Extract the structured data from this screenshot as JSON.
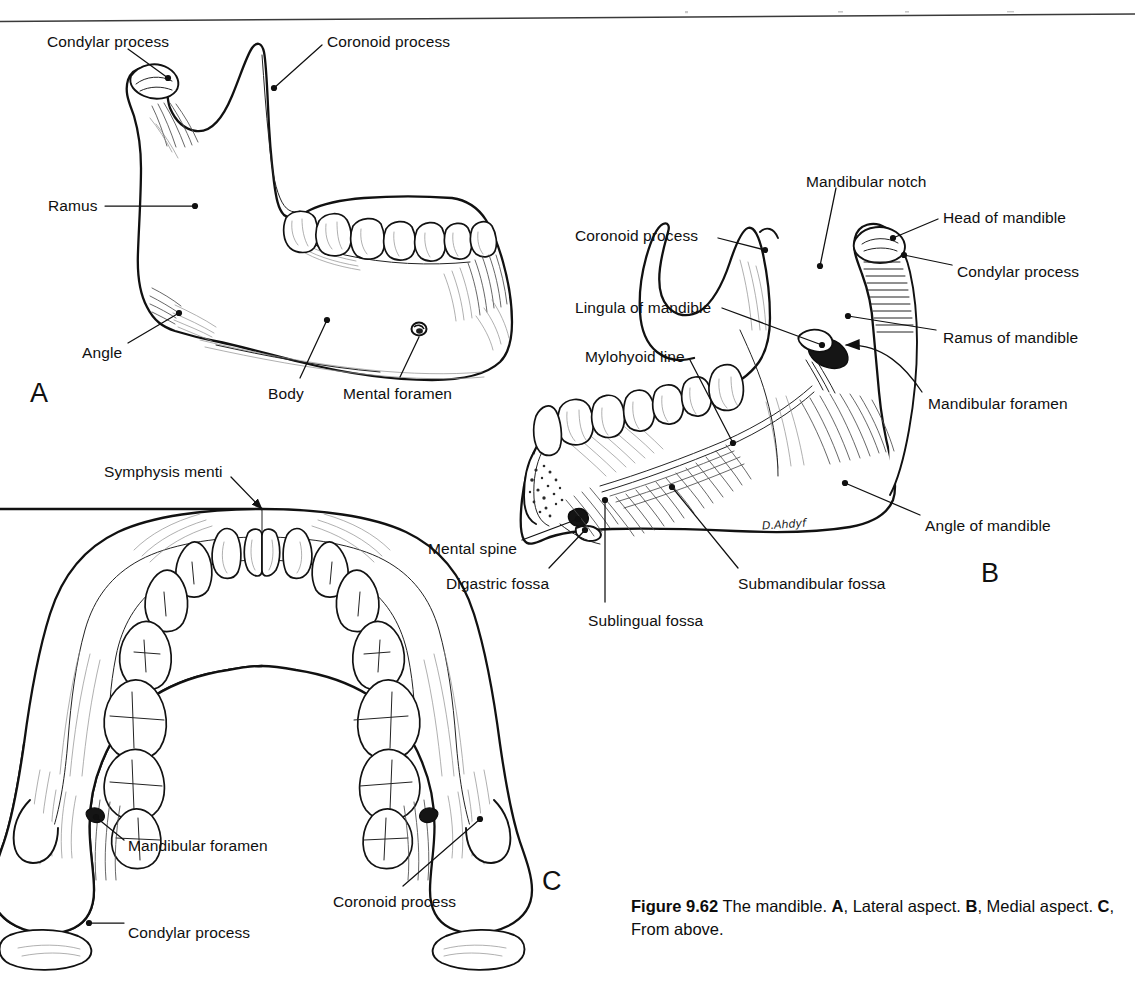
{
  "figure": {
    "number": "Figure 9.62",
    "title_text": " The mandible. ",
    "caption_parts": [
      {
        "text": "Figure 9.62",
        "bold": true
      },
      {
        "text": " The mandible. ",
        "bold": false
      },
      {
        "text": "A",
        "bold": true
      },
      {
        "text": ", Lateral aspect. ",
        "bold": false
      },
      {
        "text": "B",
        "bold": true
      },
      {
        "text": ", Medial aspect. ",
        "bold": false
      },
      {
        "text": "C",
        "bold": true
      },
      {
        "text": ", From above.",
        "bold": false
      }
    ],
    "caption_plain": "Figure 9.62 The mandible. A, Lateral aspect. B, Medial aspect. C, From above.",
    "artist_signature": "D.Ahdyf"
  },
  "panels": [
    {
      "letter": "A",
      "name": "lateral-aspect",
      "description": "Lateral aspect",
      "labels": [
        {
          "id": "a-condylar-process",
          "text": "Condylar process",
          "x": 47,
          "y": 34,
          "align": "left",
          "leader": {
            "type": "line",
            "points": [
              [
                128,
                49
              ],
              [
                168,
                78
              ]
            ]
          },
          "dot": [
            168,
            78
          ]
        },
        {
          "id": "a-coronoid-process",
          "text": "Coronoid process",
          "x": 327,
          "y": 34,
          "align": "left",
          "leader": {
            "type": "line",
            "points": [
              [
                322,
                45
              ],
              [
                274,
                88
              ]
            ]
          },
          "dot": [
            274,
            88
          ]
        },
        {
          "id": "a-ramus",
          "text": "Ramus",
          "x": 48,
          "y": 198,
          "align": "left",
          "leader": {
            "type": "line",
            "points": [
              [
                105,
                206
              ],
              [
                195,
                206
              ]
            ]
          },
          "dot": [
            195,
            206
          ]
        },
        {
          "id": "a-angle",
          "text": "Angle",
          "x": 82,
          "y": 345,
          "align": "left",
          "leader": {
            "type": "line",
            "points": [
              [
                128,
                343
              ],
              [
                179,
                313
              ]
            ]
          },
          "dot": [
            179,
            313
          ]
        },
        {
          "id": "a-body",
          "text": "Body",
          "x": 268,
          "y": 386,
          "align": "left",
          "leader": {
            "type": "line",
            "points": [
              [
                300,
                378
              ],
              [
                327,
                320
              ]
            ]
          },
          "dot": [
            327,
            320
          ]
        },
        {
          "id": "a-mental-foramen",
          "text": "Mental foramen",
          "x": 343,
          "y": 386,
          "align": "left",
          "leader": {
            "type": "line",
            "points": [
              [
                400,
                377
              ],
              [
                419,
                329
              ]
            ]
          },
          "dot": [
            419,
            329
          ]
        }
      ]
    },
    {
      "letter": "B",
      "name": "medial-aspect",
      "description": "Medial aspect",
      "labels": [
        {
          "id": "b-mandibular-notch",
          "text": "Mandibular notch",
          "x": 806,
          "y": 174,
          "align": "left",
          "leader": {
            "type": "line",
            "points": [
              [
                836,
                188
              ],
              [
                820,
                266
              ]
            ]
          },
          "dot": [
            820,
            266
          ]
        },
        {
          "id": "b-head-of-mandible",
          "text": "Head of mandible",
          "x": 943,
          "y": 210,
          "align": "left",
          "leader": {
            "type": "line",
            "points": [
              [
                938,
                219
              ],
              [
                893,
                238
              ]
            ]
          },
          "dot": [
            893,
            238
          ]
        },
        {
          "id": "b-condylar-process",
          "text": "Condylar process",
          "x": 957,
          "y": 264,
          "align": "left",
          "leader": {
            "type": "line",
            "points": [
              [
                952,
                265
              ],
              [
                904,
                255
              ]
            ]
          },
          "dot": [
            904,
            255
          ]
        },
        {
          "id": "b-coronoid-process",
          "text": "Coronoid process",
          "x": 575,
          "y": 228,
          "align": "left",
          "leader": {
            "type": "line",
            "points": [
              [
                718,
                238
              ],
              [
                765,
                250
              ]
            ]
          },
          "dot": [
            765,
            250
          ]
        },
        {
          "id": "b-lingula",
          "text": "Lingula of mandible",
          "x": 575,
          "y": 300,
          "align": "left",
          "leader": {
            "type": "line",
            "points": [
              [
                722,
                308
              ],
              [
                822,
                345
              ]
            ]
          },
          "dot": [
            822,
            345
          ]
        },
        {
          "id": "b-ramus-of-mandible",
          "text": "Ramus of mandible",
          "x": 943,
          "y": 330,
          "align": "left",
          "leader": {
            "type": "line",
            "points": [
              [
                936,
                330
              ],
              [
                848,
                316
              ]
            ]
          },
          "dot": [
            848,
            316
          ]
        },
        {
          "id": "b-mylohyoid-line",
          "text": "Mylohyoid line",
          "x": 585,
          "y": 349,
          "align": "left",
          "leader": {
            "type": "line",
            "points": [
              [
                690,
                360
              ],
              [
                733,
                443
              ]
            ]
          },
          "dot": [
            733,
            443
          ]
        },
        {
          "id": "b-mandibular-foramen",
          "text": "Mandibular foramen",
          "x": 928,
          "y": 396,
          "align": "left",
          "leader": {
            "type": "arc",
            "points": [
              [
                922,
                392
              ],
              [
                905,
                330
              ],
              [
                840,
                348
              ]
            ]
          },
          "arrow": true
        },
        {
          "id": "b-angle-of-mandible",
          "text": "Angle of mandible",
          "x": 925,
          "y": 518,
          "align": "left",
          "leader": {
            "type": "line",
            "points": [
              [
                920,
                515
              ],
              [
                845,
                483
              ]
            ]
          },
          "dot": [
            845,
            483
          ]
        },
        {
          "id": "b-mental-spine",
          "text": "Mental spine",
          "x": 428,
          "y": 541,
          "align": "left",
          "leader": {
            "type": "line",
            "points": [
              [
                522,
                540
              ],
              [
                578,
                519
              ]
            ]
          },
          "dot": [
            578,
            519
          ]
        },
        {
          "id": "b-digastric-fossa",
          "text": "Digastric fossa",
          "x": 446,
          "y": 576,
          "align": "left",
          "leader": {
            "type": "line",
            "points": [
              [
                549,
                568
              ],
              [
                585,
                530
              ]
            ]
          },
          "dot": [
            585,
            530
          ]
        },
        {
          "id": "b-sublingual-fossa",
          "text": "Sublingual fossa",
          "x": 588,
          "y": 613,
          "align": "left",
          "leader": {
            "type": "line",
            "points": [
              [
                605,
                602
              ],
              [
                605,
                500
              ]
            ]
          },
          "dot": [
            605,
            500
          ]
        },
        {
          "id": "b-submandibular-fossa",
          "text": "Submandibular fossa",
          "x": 738,
          "y": 576,
          "align": "left",
          "leader": {
            "type": "line",
            "points": [
              [
                738,
                568
              ],
              [
                672,
                487
              ]
            ]
          },
          "dot": [
            672,
            487
          ]
        }
      ]
    },
    {
      "letter": "C",
      "name": "from-above",
      "description": "From above",
      "labels": [
        {
          "id": "c-symphysis-menti",
          "text": "Symphysis menti",
          "x": 104,
          "y": 464,
          "align": "left",
          "leader": {
            "type": "line",
            "points": [
              [
                231,
                477
              ],
              [
                266,
                513
              ]
            ]
          },
          "arrow": true
        },
        {
          "id": "c-mandibular-foramen",
          "text": "Mandibular foramen",
          "x": 128,
          "y": 838,
          "align": "left",
          "leader": {
            "type": "line",
            "points": [
              [
                124,
                840
              ],
              [
                95,
                817
              ]
            ]
          },
          "dot": [
            95,
            817
          ]
        },
        {
          "id": "c-coronoid-process",
          "text": "Coronoid process",
          "x": 333,
          "y": 894,
          "align": "left",
          "leader": {
            "type": "line",
            "points": [
              [
                403,
                886
              ],
              [
                479,
                820
              ]
            ]
          },
          "dot": [
            479,
            820
          ]
        },
        {
          "id": "c-condylar-process",
          "text": "Condylar process",
          "x": 128,
          "y": 925,
          "align": "left",
          "leader": {
            "type": "line",
            "points": [
              [
                124,
                923
              ],
              [
                89,
                923
              ]
            ]
          },
          "dot": [
            89,
            923
          ]
        }
      ]
    }
  ],
  "colors": {
    "background": "#ffffff",
    "ink": "#101010",
    "rule": "#3a3a3a",
    "hatch": "#5a5a5a",
    "hatch_light": "#9a9a9a"
  }
}
